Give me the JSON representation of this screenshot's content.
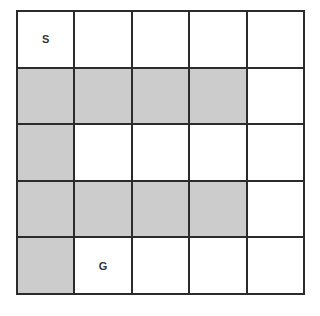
{
  "grid": {
    "rows": 5,
    "cols": 5,
    "colors": {
      "wall": "#cccccc",
      "open": "#ffffff",
      "line": "#2b2b2b"
    },
    "cells": [
      [
        {
          "type": "open",
          "label": "S"
        },
        {
          "type": "open",
          "label": ""
        },
        {
          "type": "open",
          "label": ""
        },
        {
          "type": "open",
          "label": ""
        },
        {
          "type": "open",
          "label": ""
        }
      ],
      [
        {
          "type": "wall",
          "label": ""
        },
        {
          "type": "wall",
          "label": ""
        },
        {
          "type": "wall",
          "label": ""
        },
        {
          "type": "wall",
          "label": ""
        },
        {
          "type": "open",
          "label": ""
        }
      ],
      [
        {
          "type": "wall",
          "label": ""
        },
        {
          "type": "open",
          "label": ""
        },
        {
          "type": "open",
          "label": ""
        },
        {
          "type": "open",
          "label": ""
        },
        {
          "type": "open",
          "label": ""
        }
      ],
      [
        {
          "type": "wall",
          "label": ""
        },
        {
          "type": "wall",
          "label": ""
        },
        {
          "type": "wall",
          "label": ""
        },
        {
          "type": "wall",
          "label": ""
        },
        {
          "type": "open",
          "label": ""
        }
      ],
      [
        {
          "type": "wall",
          "label": ""
        },
        {
          "type": "open",
          "label": "G"
        },
        {
          "type": "open",
          "label": ""
        },
        {
          "type": "open",
          "label": ""
        },
        {
          "type": "open",
          "label": ""
        }
      ]
    ]
  }
}
